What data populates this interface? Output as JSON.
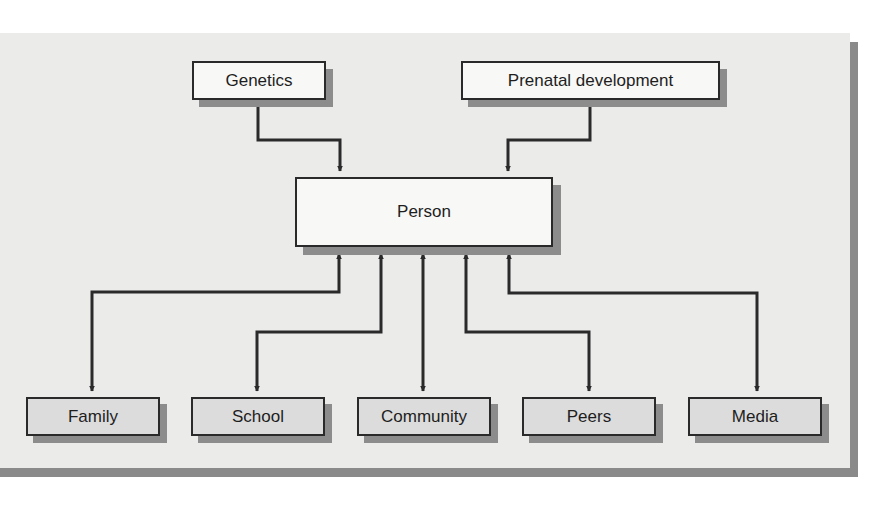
{
  "diagram": {
    "type": "influence-diagram",
    "center": {
      "id": "person",
      "label": "Person"
    },
    "inputs": [
      {
        "id": "genetics",
        "label": "Genetics",
        "direction": "one-way-into-person"
      },
      {
        "id": "prenatal",
        "label": "Prenatal development",
        "direction": "one-way-into-person"
      }
    ],
    "contexts": [
      {
        "id": "family",
        "label": "Family",
        "direction": "bidirectional"
      },
      {
        "id": "school",
        "label": "School",
        "direction": "bidirectional"
      },
      {
        "id": "community",
        "label": "Community",
        "direction": "bidirectional"
      },
      {
        "id": "peers",
        "label": "Peers",
        "direction": "bidirectional"
      },
      {
        "id": "media",
        "label": "Media",
        "direction": "bidirectional"
      }
    ],
    "colors": {
      "panel": "#ebebea",
      "panel_shadow": "#8a8a8a",
      "top_box_fill": "#f8f8f6",
      "bottom_box_fill": "#dcdcdc",
      "line": "#2a2a2a"
    }
  }
}
